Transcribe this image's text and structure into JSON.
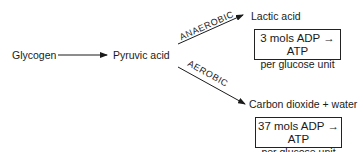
{
  "diagram": {
    "type": "flowchart",
    "nodes": {
      "glycogen": "Glycogen",
      "pyruvic_acid": "Pyruvic acid",
      "lactic_acid": "Lactic acid",
      "co2_water": "Carbon dioxide + water"
    },
    "edges": {
      "glycogen_to_pyruvic": {
        "from": "Glycogen",
        "to": "Pyruvic acid",
        "label": ""
      },
      "anaerobic": {
        "from": "Pyruvic acid",
        "to": "Lactic acid",
        "label": "ANAEROBIC"
      },
      "aerobic": {
        "from": "Pyruvic acid",
        "to": "Carbon dioxide + water",
        "label": "AEROBIC"
      }
    },
    "boxes": {
      "anaerobic_yield": {
        "line1": "3 mols ADP → ATP",
        "line2": "per glucose unit"
      },
      "aerobic_yield": {
        "line1": "37 mols ADP → ATP",
        "line2": "per glucose unit"
      }
    },
    "colors": {
      "ink": "#1a1a1a",
      "background": "#ffffff"
    }
  }
}
